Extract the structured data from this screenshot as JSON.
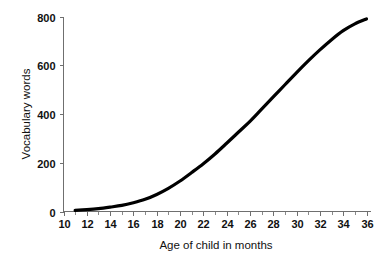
{
  "chart_data": {
    "type": "line",
    "title": "",
    "subtitle": "",
    "xlabel": "Age of child in months",
    "ylabel": "Vocabulary words",
    "xlim": [
      10,
      36
    ],
    "ylim": [
      0,
      800
    ],
    "grid": false,
    "legend": null,
    "legend_position": "none",
    "x_ticks": [
      10,
      12,
      14,
      16,
      18,
      20,
      22,
      24,
      26,
      28,
      30,
      32,
      34,
      36
    ],
    "x_tick_labels": [
      "10",
      "12",
      "14",
      "16",
      "18",
      "20",
      "22",
      "24",
      "26",
      "28",
      "30",
      "32",
      "34",
      "36"
    ],
    "x_minor_ticks": [
      11,
      13,
      15,
      17,
      19,
      21,
      23,
      25,
      27,
      29,
      31,
      33,
      35
    ],
    "y_ticks": [
      0,
      200,
      400,
      600,
      800
    ],
    "y_tick_labels": [
      "0",
      "200",
      "400",
      "600",
      "800"
    ],
    "series": [
      {
        "name": "Vocabulary growth",
        "color": "#000000",
        "line_width": 3.2,
        "x": [
          11,
          12,
          13,
          14,
          15,
          16,
          17,
          18,
          19,
          20,
          21,
          22,
          23,
          24,
          25,
          26,
          27,
          28,
          29,
          30,
          31,
          32,
          33,
          34,
          35,
          36
        ],
        "values": [
          5,
          8,
          12,
          18,
          25,
          36,
          50,
          70,
          95,
          125,
          160,
          196,
          236,
          280,
          325,
          370,
          420,
          470,
          520,
          570,
          618,
          663,
          705,
          742,
          770,
          790
        ]
      }
    ],
    "annotations": []
  },
  "colors": {
    "background": "#ffffff",
    "axis": "#6f6f6f",
    "text": "#111111",
    "series": "#000000"
  },
  "axis_titles": {
    "x": "Age of child in months",
    "y": "Vocabulary words"
  }
}
